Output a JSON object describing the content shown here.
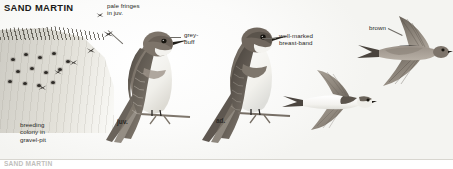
{
  "plate": {
    "title": "SAND MARTIN",
    "bottom_caption": "SAND MARTIN"
  },
  "labels": {
    "pale_fringes": "pale fringes\nin juv.",
    "grey_buff": "grey-\nbuff",
    "breast_band": "well-marked\nbreast-band",
    "brown": "brown",
    "colony": "breeding\ncolony in\ngravel-pit",
    "juvenile": "juv.",
    "adult": "ad."
  },
  "figures": [
    {
      "name": "perched-juvenile",
      "age": "juv."
    },
    {
      "name": "perched-adult",
      "age": "ad."
    },
    {
      "name": "flying-underside",
      "view": "from below"
    },
    {
      "name": "flying-upperside",
      "view": "from above"
    }
  ],
  "colony": {
    "nest_hole_count": 13,
    "distant_bird_count": 6
  },
  "colors": {
    "upperparts_brown": "#8a8076",
    "underparts_white": "#f6f5f2",
    "breast_band": "#8d857b",
    "bank_sand": "#d6d4cc",
    "ink": "#2a2825"
  }
}
